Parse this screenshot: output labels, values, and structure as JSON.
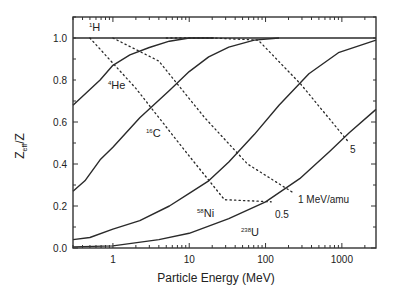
{
  "chart_data": {
    "type": "line",
    "title": "",
    "xlabel": "Particle Energy (MeV)",
    "ylabel": "Z_eff/Z",
    "xscale": "log",
    "xlim": [
      0.3,
      2800
    ],
    "ylim": [
      0.0,
      1.1
    ],
    "xticks": [
      1,
      10,
      100,
      1000
    ],
    "xtick_labels": [
      "1",
      "10",
      "100",
      "1000"
    ],
    "yticks": [
      0.0,
      0.2,
      0.4,
      0.6,
      0.8,
      1.0
    ],
    "ytick_labels": [
      "0.0",
      "0.2",
      "0.4",
      "0.6",
      "0.8",
      "1.0"
    ],
    "grid": false,
    "legend": "none (inline labels)",
    "series": [
      {
        "name": "1H",
        "mass": "1",
        "symbol": "H",
        "style": "solid",
        "x": [
          0.3,
          2800
        ],
        "y": [
          1.0,
          1.0
        ]
      },
      {
        "name": "4He",
        "mass": "4",
        "symbol": "He",
        "style": "solid",
        "x": [
          0.3,
          0.68,
          1,
          1.67,
          3,
          5.5,
          10,
          21
        ],
        "y": [
          0.68,
          0.8,
          0.87,
          0.92,
          0.955,
          0.985,
          1.0,
          1.0
        ]
      },
      {
        "name": "16C",
        "mass": "16",
        "symbol": "C",
        "style": "solid",
        "x": [
          0.3,
          0.43,
          0.68,
          1,
          2.25,
          5.5,
          10,
          18,
          33,
          71,
          150
        ],
        "y": [
          0.27,
          0.32,
          0.42,
          0.48,
          0.62,
          0.75,
          0.84,
          0.91,
          0.956,
          0.99,
          1.0
        ]
      },
      {
        "name": "58Ni",
        "mass": "58",
        "symbol": "Ni",
        "style": "solid",
        "x": [
          0.3,
          0.5,
          1,
          2.25,
          5.5,
          10,
          18,
          33,
          71,
          150,
          370,
          900,
          2800
        ],
        "y": [
          0.04,
          0.05,
          0.09,
          0.13,
          0.2,
          0.26,
          0.32,
          0.41,
          0.54,
          0.68,
          0.83,
          0.93,
          0.99
        ]
      },
      {
        "name": "238U",
        "mass": "238",
        "symbol": "U",
        "style": "solid",
        "x": [
          0.3,
          1,
          4,
          10,
          33,
          100,
          280,
          690,
          1260,
          2800
        ],
        "y": [
          0.005,
          0.01,
          0.04,
          0.07,
          0.14,
          0.22,
          0.33,
          0.46,
          0.55,
          0.66
        ]
      },
      {
        "name": "0.5 MeV/amu",
        "style": "dotted",
        "x": [
          0.5,
          2,
          8.5,
          29,
          119
        ],
        "y": [
          1.0,
          0.76,
          0.47,
          0.23,
          0.22
        ]
      },
      {
        "name": "1 MeV/amu",
        "style": "dotted",
        "x": [
          1,
          4,
          16,
          58,
          238
        ],
        "y": [
          1.0,
          0.89,
          0.62,
          0.4,
          0.26
        ]
      },
      {
        "name": "5 MeV/amu",
        "style": "dotted",
        "x": [
          5,
          20,
          80,
          290,
          1190
        ],
        "y": [
          1.0,
          1.0,
          0.99,
          0.78,
          0.51
        ]
      }
    ],
    "annotations": [
      {
        "text": "1 MeV/amu",
        "x": 300,
        "y": 0.27
      },
      {
        "text": "0.5",
        "x": 140,
        "y": 0.15
      },
      {
        "text": "5",
        "x": 1100,
        "y": 0.38
      }
    ]
  },
  "labels": {
    "h_mass": "1",
    "h_sym": "H",
    "he_mass": "4",
    "he_sym": "He",
    "c_mass": "16",
    "c_sym": "C",
    "ni_mass": "58",
    "ni_sym": "Ni",
    "u_mass": "238",
    "u_sym": "U",
    "amu_1": "1 MeV/amu",
    "amu_05": "0.5",
    "amu_5": "5",
    "ylabel_main": "Z",
    "ylabel_sub": "eff",
    "ylabel_tail": "/Z"
  }
}
